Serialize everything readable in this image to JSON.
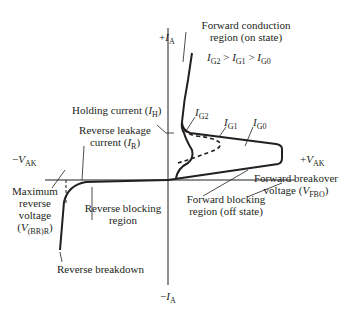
{
  "diagram": {
    "type": "SCR anode characteristic (I-V) curve",
    "axes": {
      "pos_y": {
        "sign": "+",
        "var": "I",
        "sub": "A"
      },
      "neg_y": {
        "sign": "−",
        "var": "I",
        "sub": "A"
      },
      "pos_x": {
        "sign": "+",
        "var": "V",
        "sub": "AK"
      },
      "neg_x": {
        "sign": "−",
        "var": "V",
        "sub": "AK"
      }
    },
    "labels": {
      "forward_conduction": {
        "line1": "Forward conduction",
        "line2": "region (on state)"
      },
      "gate_relation": {
        "v1": "I",
        "s1": "G2",
        "op1": " > ",
        "v2": "I",
        "s2": "G1",
        "op2": " > ",
        "v3": "I",
        "s3": "G0"
      },
      "holding_current": {
        "text": "Holding current (",
        "var": "I",
        "sub": "H",
        "close": ")"
      },
      "curve_ig2": {
        "var": "I",
        "sub": "G2"
      },
      "curve_ig1": {
        "var": "I",
        "sub": "G1"
      },
      "curve_ig0": {
        "var": "I",
        "sub": "G0"
      },
      "reverse_leakage": {
        "line1": "Reverse leakage",
        "line2": "current (",
        "var": "I",
        "sub": "R",
        "close": ")"
      },
      "max_reverse": {
        "line1": "Maximum",
        "line2": "reverse",
        "line3": "voltage",
        "open": "(",
        "var": "V",
        "sub": "(BR)R",
        "close": ")"
      },
      "reverse_blocking": {
        "line1": "Reverse blocking",
        "line2": "region"
      },
      "forward_blocking": {
        "line1": "Forward blocking",
        "line2": "region (off state)"
      },
      "forward_breakover": {
        "line1": "Forward breakover",
        "line2": "voltage (",
        "var": "V",
        "sub": "FBO",
        "close": ")"
      },
      "reverse_breakdown": {
        "text": "Reverse breakdown"
      }
    },
    "colors": {
      "ink": "#231f20",
      "background": "#ffffff"
    }
  }
}
